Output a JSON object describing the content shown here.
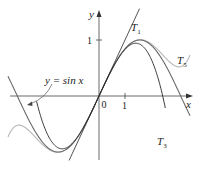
{
  "chart_data": {
    "type": "line",
    "title": "",
    "xlabel": "x",
    "ylabel": "y",
    "xlim": [
      -3.6,
      3.6
    ],
    "ylim": [
      -1.15,
      1.55
    ],
    "x_ticks": [
      {
        "value": 0,
        "label": "0"
      },
      {
        "value": 1,
        "label": "1"
      }
    ],
    "y_ticks": [
      {
        "value": 1,
        "label": "1"
      }
    ],
    "grid": false,
    "series": [
      {
        "name": "y = sin x",
        "expression": "sin(x)",
        "color": "#555555",
        "style": "dark"
      },
      {
        "name": "T1",
        "expression": "x",
        "color": "#222222"
      },
      {
        "name": "T3",
        "expression": "x - x^3/6",
        "color": "#333333"
      },
      {
        "name": "T5",
        "expression": "x - x^3/6 + x^5/120",
        "color": "#aaaaaa"
      }
    ],
    "annotations": [
      {
        "text": "y = sin x",
        "points_to": "sin curve near x=-2.6"
      },
      {
        "text": "T1",
        "near": [
          1.3,
          1.4
        ]
      },
      {
        "text": "T3",
        "near": [
          2.3,
          -0.9
        ]
      },
      {
        "text": "T5",
        "near": [
          3.3,
          0.45
        ]
      }
    ]
  },
  "labels": {
    "y_axis": "y",
    "x_axis": "x",
    "origin": "0",
    "x_tick_1": "1",
    "y_tick_1": "1",
    "sin_label": "y = sin x",
    "t1_main": "T",
    "t1_sub": "1",
    "t3_main": "T",
    "t3_sub": "3",
    "t5_main": "T",
    "t5_sub": "5"
  }
}
